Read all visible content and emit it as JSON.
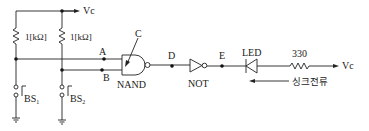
{
  "diagram": {
    "type": "logic-circuit",
    "supply_label": "Vc",
    "resistors": [
      {
        "id": "R1",
        "label": "1[kΩ]"
      },
      {
        "id": "R2",
        "label": "1[kΩ]"
      },
      {
        "id": "R3",
        "label": "330"
      }
    ],
    "switches": [
      {
        "id": "BS1",
        "label": "BS",
        "sub": "1"
      },
      {
        "id": "BS2",
        "label": "BS",
        "sub": "2"
      }
    ],
    "nodes": {
      "A": "A",
      "B": "B",
      "C": "C",
      "D": "D",
      "E": "E"
    },
    "gates": {
      "nand": "NAND",
      "not": "NOT"
    },
    "led_label": "LED",
    "sink_current_label": "싱크전류",
    "vc_right_label": "Vc"
  }
}
